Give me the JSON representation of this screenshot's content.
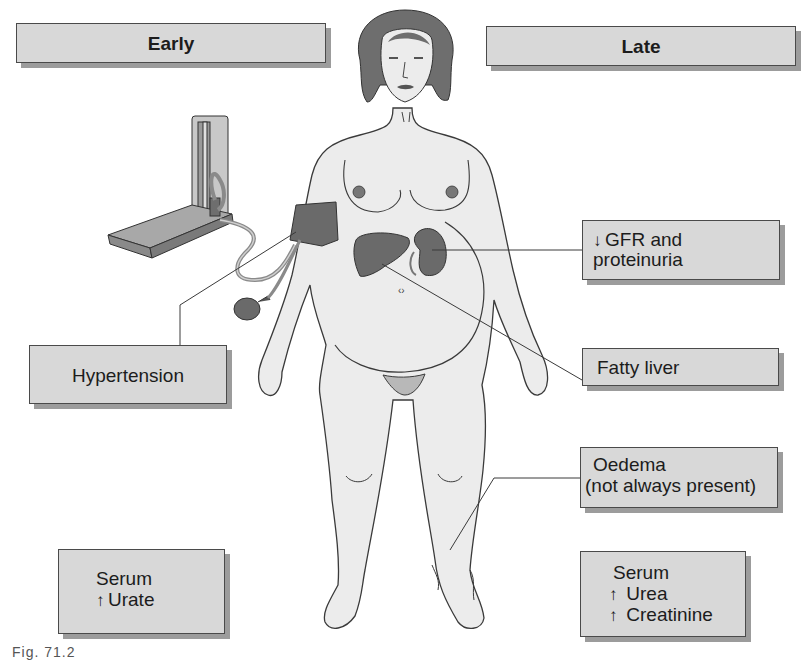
{
  "headers": {
    "early": "Early",
    "late": "Late"
  },
  "early_features": {
    "hypertension": "Hypertension",
    "serum_label": "Serum",
    "urate": "Urate",
    "urate_arrow": "↑"
  },
  "late_features": {
    "gfr_arrow": "↓",
    "gfr_line1": "GFR and",
    "gfr_line2": "proteinuria",
    "fatty_liver": "Fatty liver",
    "oedema_line1": "Oedema",
    "oedema_line2": "(not always present)",
    "serum_label": "Serum",
    "urea_arrow": "↑",
    "urea": "Urea",
    "creatinine_arrow": "↑",
    "creatinine": "Creatinine"
  },
  "caption": "Fig. 71.2",
  "colors": {
    "box_fill": "#d8d8d8",
    "box_border": "#4a4a4a",
    "box_shadow": "#9c9c9c",
    "skin": "#ececec",
    "hair": "#6e6e6e",
    "organ": "#6a6a6a",
    "outline": "#3a3a3a"
  }
}
